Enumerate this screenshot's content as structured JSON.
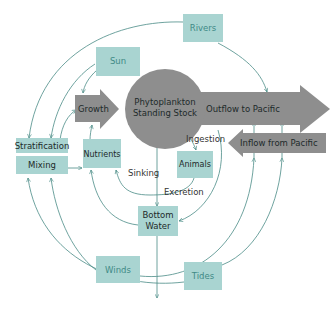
{
  "diagram": {
    "colors": {
      "box_fill": "#a9d4d1",
      "grey_shapes": "#8e8e8e",
      "connector": "#4a8c86",
      "teal_text": "#3f8a86",
      "dark_text": "#1d2a2a"
    },
    "nodes": {
      "sun": "Sun",
      "rivers": "Rivers",
      "growth": "Growth",
      "phytoplankton_line1": "Phytoplankton",
      "phytoplankton_line2": "Standing Stock",
      "outflow": "Outflow to Pacific",
      "inflow": "Inflow from Pacific",
      "stratification": "Stratification",
      "mixing": "Mixing",
      "nutrients": "Nutrients",
      "animals": "Animals",
      "bottom_water_line1": "Bottom",
      "bottom_water_line2": "Water",
      "winds": "Winds",
      "tides": "Tides"
    },
    "edge_labels": {
      "ingestion": "Ingestion",
      "sinking": "Sinking",
      "excretion": "Excretion"
    }
  }
}
